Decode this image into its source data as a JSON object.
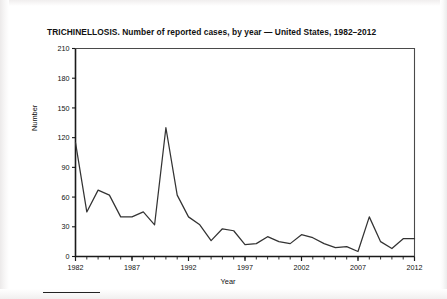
{
  "figure": {
    "title": "TRICHINELLOSIS. Number of reported cases, by year — United States, 1982–2012",
    "xlabel": "Year",
    "ylabel": "Number"
  },
  "chart_data": {
    "type": "line",
    "title": "TRICHINELLOSIS. Number of reported cases, by year — United States, 1982–2012",
    "xlabel": "Year",
    "ylabel": "Number",
    "xlim": [
      1982,
      2012
    ],
    "ylim": [
      0,
      210
    ],
    "yticks": [
      0,
      30,
      60,
      90,
      120,
      150,
      180,
      210
    ],
    "ytick_labels": [
      "0",
      "30",
      "60",
      "90",
      "120",
      "150",
      "180",
      "210"
    ],
    "xticks": [
      1982,
      1987,
      1992,
      1997,
      2002,
      2007,
      2012
    ],
    "xtick_labels": [
      "1982",
      "1987",
      "1992",
      "1997",
      "2002",
      "2007",
      "2012"
    ],
    "xtick_minor_step": 1,
    "grid": false,
    "legend": false,
    "line_color": "#333333",
    "series": [
      {
        "name": "Reported cases",
        "x": [
          1982,
          1983,
          1984,
          1985,
          1986,
          1987,
          1988,
          1989,
          1990,
          1991,
          1992,
          1993,
          1994,
          1995,
          1996,
          1997,
          1998,
          1999,
          2000,
          2001,
          2002,
          2003,
          2004,
          2005,
          2006,
          2007,
          2008,
          2009,
          2010,
          2011,
          2012
        ],
        "values": [
          115,
          45,
          67,
          62,
          40,
          40,
          45,
          32,
          130,
          62,
          40,
          32,
          16,
          28,
          26,
          12,
          13,
          20,
          15,
          13,
          22,
          19,
          13,
          9,
          10,
          5,
          40,
          15,
          8,
          18,
          18
        ]
      }
    ]
  }
}
